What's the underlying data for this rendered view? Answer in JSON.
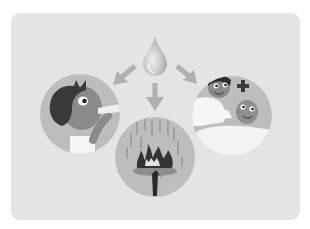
{
  "illustration": {
    "subject": "water-drop-uses",
    "center": {
      "icon": "water-drop-icon"
    },
    "panels": [
      {
        "name": "drinking",
        "description": "boy drinking from a cup"
      },
      {
        "name": "firefighting",
        "description": "rain falling on a burning tree"
      },
      {
        "name": "healthcare",
        "description": "nurse caring for a baby with medical cross"
      }
    ],
    "colors": {
      "background": "#ffffff",
      "card": "#e4e4e4",
      "circle": "#bdbdbd",
      "arrow": "#b0b0b0",
      "dark": "#3a3a3a",
      "skin": "#8a8a8a",
      "white": "#f7f7f7"
    }
  }
}
